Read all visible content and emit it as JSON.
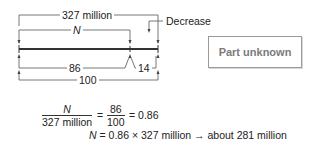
{
  "diagram": {
    "whole_label": "327 million",
    "part_label": "N",
    "decrease_label": "Decrease",
    "part_percent_label": "86",
    "decrease_percent_label": "14",
    "total_percent_label": "100",
    "unknown_box_label": "Part unknown"
  },
  "equations": {
    "fraction_left_num": "N",
    "fraction_left_den": "327 million",
    "equals_1": "=",
    "fraction_right_num": "86",
    "fraction_right_den": "100",
    "result_1": "= 0.86",
    "solution_var": "N",
    "solution_rest": " = 0.86 × 327 million → about 281 million"
  },
  "colors": {
    "line": "#333333",
    "box_border": "#9a9a9a",
    "box_text": "#7a7a7a"
  }
}
